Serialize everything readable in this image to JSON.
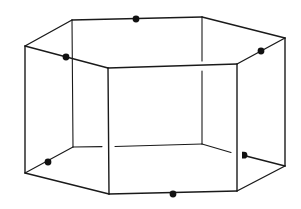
{
  "figure": {
    "title": "",
    "line_color": "#1a1a1a",
    "dot_color": "#111111",
    "background": "#ffffff",
    "faces": {
      "top": [
        "top-left",
        "top-back-left",
        "top-back-right",
        "top-right",
        "top-front-right",
        "top-front-left"
      ],
      "bottom": [
        "bottom-left",
        "bottom-back-left",
        "bottom-back-right",
        "bottom-right",
        "bottom-front-right",
        "bottom-front-left"
      ]
    },
    "marked_points": [
      {
        "name": "midpoint-top-back-edge",
        "on_edge": "top-back-left to top-back-right",
        "shape": "full"
      },
      {
        "name": "midpoint-top-front-left-edge",
        "on_edge": "top-left to top-front-left",
        "shape": "full"
      },
      {
        "name": "midpoint-top-front-right-edge",
        "on_edge": "top-right to top-front-right",
        "shape": "full"
      },
      {
        "name": "midpoint-bottom-back-left-edge",
        "on_edge": "bottom-left to bottom-back-left",
        "shape": "full"
      },
      {
        "name": "midpoint-bottom-front-edge",
        "on_edge": "bottom-front-left to bottom-front-right",
        "shape": "full"
      },
      {
        "name": "midpoint-bottom-back-right-edge",
        "on_edge": "bottom-back-right to bottom-right",
        "shape": "half-hidden"
      }
    ]
  }
}
